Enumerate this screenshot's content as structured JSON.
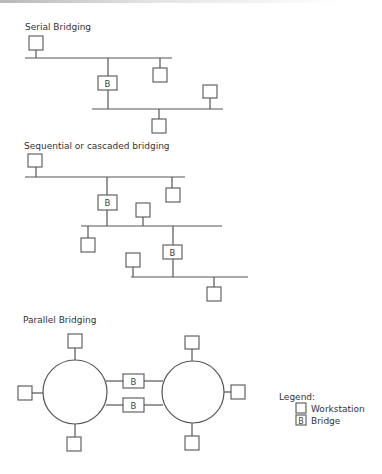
{
  "diagram": {
    "sections": [
      {
        "title": "Serial Bridging"
      },
      {
        "title": "Sequential or cascaded bridging"
      },
      {
        "title": "Parallel Bridging"
      }
    ],
    "bridge_label": "B",
    "legend": {
      "title": "Legend:",
      "items": [
        {
          "symbol": "empty-box",
          "label": "Workstation"
        },
        {
          "symbol": "box-with-B",
          "label": "Bridge"
        }
      ]
    }
  }
}
